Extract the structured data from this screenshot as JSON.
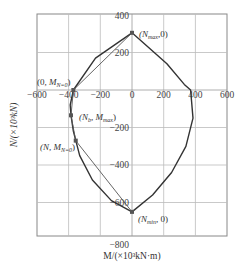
{
  "chart_data": {
    "type": "line",
    "title": "",
    "xlabel": "M/(×10³kN·m)",
    "ylabel": "N/(×10³kN)",
    "xlim": [
      -600,
      600
    ],
    "ylim": [
      -780,
      400
    ],
    "grid": true,
    "x_ticks": [
      -600,
      -400,
      -200,
      0,
      200,
      400,
      600
    ],
    "y_ticks": [
      400,
      200,
      -200,
      -400,
      -600,
      -800
    ],
    "x_tick_labels": [
      "−600",
      "−400",
      "−200",
      "0",
      "200",
      "400",
      "600"
    ],
    "y_tick_labels": [
      "400",
      "200",
      "−200",
      "−400",
      "−600",
      "−800"
    ],
    "series": [
      {
        "name": "interaction curve (outer)",
        "points": [
          {
            "M": 0,
            "N": 305
          },
          {
            "M": -230,
            "N": 170
          },
          {
            "M": -370,
            "N": 0
          },
          {
            "M": -390,
            "N": -80
          },
          {
            "M": -385,
            "N": -135
          },
          {
            "M": -370,
            "N": -220
          },
          {
            "M": -330,
            "N": -350
          },
          {
            "M": -250,
            "N": -480
          },
          {
            "M": -130,
            "N": -590
          },
          {
            "M": 0,
            "N": -650
          },
          {
            "M": 130,
            "N": -560
          },
          {
            "M": 250,
            "N": -440
          },
          {
            "M": 340,
            "N": -300
          },
          {
            "M": 385,
            "N": -150
          },
          {
            "M": 370,
            "N": 0
          },
          {
            "M": 330,
            "N": 30
          },
          {
            "M": 220,
            "N": 140
          },
          {
            "M": 0,
            "N": 305
          }
        ]
      },
      {
        "name": "simplified polyline (inner)",
        "points": [
          {
            "M": 0,
            "N": 305
          },
          {
            "M": -370,
            "N": 0
          },
          {
            "M": -385,
            "N": -135
          },
          {
            "M": -355,
            "N": -270
          },
          {
            "M": 0,
            "N": -650
          }
        ]
      }
    ],
    "annotations": [
      {
        "label": "(N_max, 0)",
        "M": 0,
        "N": 305
      },
      {
        "label": "(0, M_N=0)",
        "M": -370,
        "N": 0
      },
      {
        "label": "(N_b, M_max)",
        "M": -385,
        "N": -135
      },
      {
        "label": "(N, M_N=0)",
        "M": -355,
        "N": -270
      },
      {
        "label": "(N_min, 0)",
        "M": 0,
        "N": -650
      }
    ],
    "legend": "none"
  },
  "labels": {
    "ylabel": "N/(×10³kN)",
    "xlabel": "M/(×10³kN·m)",
    "ann_nmax_main": "(N",
    "ann_nmax_sub": "max",
    "ann_nmax_tail": ",0)",
    "ann_m0_main": "(0, M",
    "ann_m0_sub": "N=0",
    "ann_m0_tail": ")",
    "ann_nb_main": "(N",
    "ann_nb_sub": "b",
    "ann_nb_mid": ", M",
    "ann_nb_sub2": "max",
    "ann_nb_tail": ")",
    "ann_n_main": "(N, M",
    "ann_n_sub": "N=0",
    "ann_n_tail": ")",
    "ann_nmin_main": "(N",
    "ann_nmin_sub": "min",
    "ann_nmin_tail": ", 0)"
  },
  "colors": {
    "curve": "#333333",
    "inner": "#555555",
    "grid": "#bbbbbb",
    "frame": "#888888",
    "point": "#555555"
  }
}
